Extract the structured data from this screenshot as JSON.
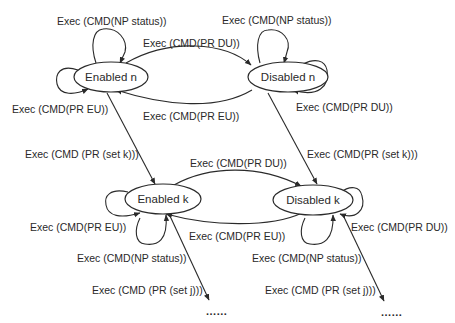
{
  "diagram": {
    "type": "state-transition",
    "states": {
      "enabled_n": "Enabled n",
      "disabled_n": "Disabled n",
      "enabled_k": "Enabled k",
      "disabled_k": "Disabled k"
    },
    "labels": {
      "enabled_n_np_status": "Exec (CMD(NP status))",
      "disabled_n_np_status": "Exec (CMD(NP status))",
      "n_pr_du": "Exec (CMD(PR DU))",
      "n_pr_eu": "Exec (CMD(PR EU))",
      "enabled_n_self_eu": "Exec (CMD(PR EU))",
      "disabled_n_self_du": "Exec (CMD(PR DU))",
      "enabled_n_set_k": "Exec (CMD (PR (set k)))",
      "disabled_n_set_k": "Exec (CMD(PR (set k)))",
      "k_pr_du": "Exec (CMD(PR DU))",
      "k_pr_eu": "Exec (CMD(PR EU))",
      "enabled_k_self_eu": "Exec (CMD(PR EU))",
      "disabled_k_self_du": "Exec (CMD(PR DU))",
      "enabled_k_np_status": "Exec (CMD(NP status))",
      "disabled_k_np_status": "Exec (CMD(NP status))",
      "enabled_k_set_j": "Exec (CMD (PR (set j)))",
      "disabled_k_set_j": "Exec (CMD (PR (set j)))",
      "continuation_left": "......",
      "continuation_right": "......"
    },
    "transitions": [
      {
        "from": "Enabled n",
        "to": "Enabled n",
        "label": "Exec (CMD(NP status))"
      },
      {
        "from": "Enabled n",
        "to": "Enabled n",
        "label": "Exec (CMD(PR EU))"
      },
      {
        "from": "Enabled n",
        "to": "Disabled n",
        "label": "Exec (CMD(PR DU))"
      },
      {
        "from": "Disabled n",
        "to": "Enabled n",
        "label": "Exec (CMD(PR EU))"
      },
      {
        "from": "Disabled n",
        "to": "Disabled n",
        "label": "Exec (CMD(NP status))"
      },
      {
        "from": "Disabled n",
        "to": "Disabled n",
        "label": "Exec (CMD(PR DU))"
      },
      {
        "from": "Enabled n",
        "to": "Enabled k",
        "label": "Exec (CMD (PR (set k)))"
      },
      {
        "from": "Disabled n",
        "to": "Disabled k",
        "label": "Exec (CMD(PR (set k)))"
      },
      {
        "from": "Enabled k",
        "to": "Disabled k",
        "label": "Exec (CMD(PR DU))"
      },
      {
        "from": "Disabled k",
        "to": "Enabled k",
        "label": "Exec (CMD(PR EU))"
      },
      {
        "from": "Enabled k",
        "to": "Enabled k",
        "label": "Exec (CMD(PR EU))"
      },
      {
        "from": "Enabled k",
        "to": "Enabled k",
        "label": "Exec (CMD(NP status))"
      },
      {
        "from": "Disabled k",
        "to": "Disabled k",
        "label": "Exec (CMD(PR DU))"
      },
      {
        "from": "Disabled k",
        "to": "Disabled k",
        "label": "Exec (CMD(NP status))"
      },
      {
        "from": "Enabled k",
        "to": "......",
        "label": "Exec (CMD (PR (set j)))"
      },
      {
        "from": "Disabled k",
        "to": "......",
        "label": "Exec (CMD (PR (set j)))"
      }
    ]
  }
}
